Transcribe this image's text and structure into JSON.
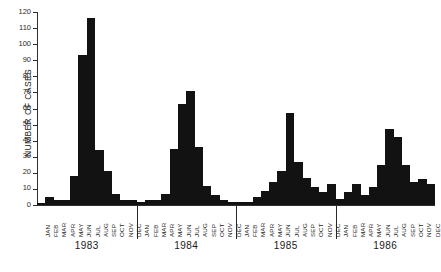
{
  "chart_data": {
    "type": "bar",
    "title": "",
    "xlabel": "",
    "ylabel": "NUMBER OF CASES",
    "ylim": [
      0,
      120
    ],
    "ytick_step": 10,
    "yticks": [
      0,
      10,
      20,
      30,
      40,
      50,
      60,
      70,
      80,
      90,
      100,
      110,
      120
    ],
    "grid": false,
    "legend": null,
    "bar_color": "#121212",
    "axis_color": "#303030",
    "months": [
      "JAN",
      "FEB",
      "MAR",
      "APR",
      "MAY",
      "JUN",
      "JUL",
      "AUG",
      "SEP",
      "OCT",
      "NOV",
      "DEC"
    ],
    "years": [
      "1983",
      "1984",
      "1985",
      "1986"
    ],
    "categories": [
      "1983-JAN",
      "1983-FEB",
      "1983-MAR",
      "1983-APR",
      "1983-MAY",
      "1983-JUN",
      "1983-JUL",
      "1983-AUG",
      "1983-SEP",
      "1983-OCT",
      "1983-NOV",
      "1983-DEC",
      "1984-JAN",
      "1984-FEB",
      "1984-MAR",
      "1984-APR",
      "1984-MAY",
      "1984-JUN",
      "1984-JUL",
      "1984-AUG",
      "1984-SEP",
      "1984-OCT",
      "1984-NOV",
      "1984-DEC",
      "1985-JAN",
      "1985-FEB",
      "1985-MAR",
      "1985-APR",
      "1985-MAY",
      "1985-JUN",
      "1985-JUL",
      "1985-AUG",
      "1985-SEP",
      "1985-OCT",
      "1985-NOV",
      "1985-DEC",
      "1986-JAN",
      "1986-FEB",
      "1986-MAR",
      "1986-APR",
      "1986-MAY",
      "1986-JUN",
      "1986-JUL",
      "1986-AUG",
      "1986-SEP",
      "1986-OCT",
      "1986-NOV",
      "1986-DEC"
    ],
    "values": [
      1,
      5,
      3,
      3,
      18,
      93,
      116,
      34,
      21,
      7,
      3,
      3,
      2,
      3,
      3,
      7,
      35,
      63,
      71,
      36,
      12,
      6,
      3,
      2,
      2,
      2,
      5,
      9,
      14,
      21,
      57,
      27,
      17,
      11,
      8,
      13,
      4,
      8,
      13,
      6,
      11,
      25,
      47,
      42,
      25,
      14,
      16,
      13
    ],
    "series": [
      {
        "name": "Number of cases",
        "values": [
          1,
          5,
          3,
          3,
          18,
          93,
          116,
          34,
          21,
          7,
          3,
          3,
          2,
          3,
          3,
          7,
          35,
          63,
          71,
          36,
          12,
          6,
          3,
          2,
          2,
          2,
          5,
          9,
          14,
          21,
          57,
          27,
          17,
          11,
          8,
          13,
          4,
          8,
          13,
          6,
          11,
          25,
          47,
          42,
          25,
          14,
          16,
          13
        ]
      }
    ],
    "by_year": [
      {
        "year": "1983",
        "values": [
          1,
          5,
          3,
          3,
          18,
          93,
          116,
          34,
          21,
          7,
          3,
          3
        ]
      },
      {
        "year": "1984",
        "values": [
          2,
          3,
          3,
          7,
          35,
          63,
          71,
          36,
          12,
          6,
          3,
          2
        ]
      },
      {
        "year": "1985",
        "values": [
          2,
          2,
          5,
          9,
          14,
          21,
          57,
          27,
          17,
          11,
          8,
          13
        ]
      },
      {
        "year": "1986",
        "values": [
          4,
          8,
          13,
          6,
          11,
          25,
          47,
          42,
          25,
          14,
          16,
          13
        ]
      }
    ]
  }
}
